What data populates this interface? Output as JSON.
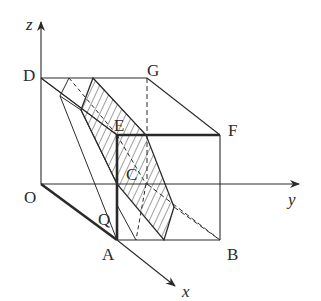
{
  "diagram": {
    "type": "3d-coordinate-geometry",
    "colors": {
      "stroke": "#2a2a2a",
      "background": "#ffffff"
    },
    "axes": {
      "x": {
        "label": "x"
      },
      "y": {
        "label": "y"
      },
      "z": {
        "label": "z"
      }
    },
    "points": {
      "O": {
        "label": "O"
      },
      "A": {
        "label": "A"
      },
      "B": {
        "label": "B"
      },
      "C": {
        "label": "C"
      },
      "D": {
        "label": "D"
      },
      "E": {
        "label": "E"
      },
      "F": {
        "label": "F"
      },
      "G": {
        "label": "G"
      },
      "Q": {
        "label": "Q"
      }
    },
    "shaded_region": {
      "style": "hatched"
    }
  }
}
